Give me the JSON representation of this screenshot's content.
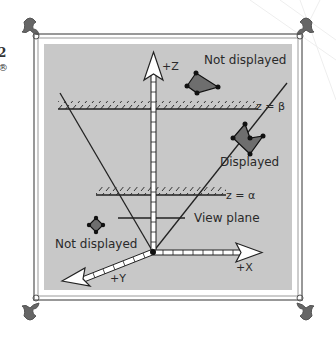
{
  "figure": {
    "axes": {
      "z_label": "+Z",
      "x_label": "+X",
      "y_label": "+Y"
    },
    "planes": {
      "far_label": "z = β",
      "near_label": "z = α",
      "view_plane_label": "View plane"
    },
    "objects": [
      {
        "label": "Not displayed",
        "position": "above far plane"
      },
      {
        "label": "Displayed",
        "position": "inside view volume"
      },
      {
        "label": "Not displayed",
        "position": "outside view volume, left"
      }
    ],
    "edge_fragments": [
      "2",
      "®"
    ]
  },
  "colors": {
    "panel_fill": "#c8c8c8",
    "frame_line": "#6f6f6f",
    "line_dark": "#222222",
    "polygon_fill": "#6e6e6e",
    "vertex": "#111111",
    "arrow_fill": "#ffffff"
  }
}
